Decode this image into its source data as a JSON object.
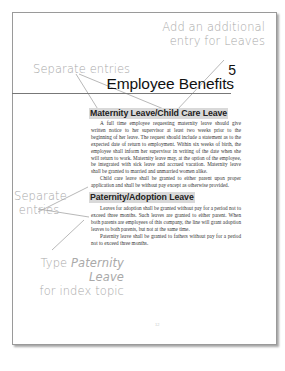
{
  "callouts": {
    "additional_entry": {
      "line1": "Add an additional",
      "line2": "entry for Leaves"
    },
    "separate_entries_top": "Separate entries",
    "separate_entries_left": {
      "line1": "Separate",
      "line2": "entries"
    },
    "type_topic": {
      "prefix": "Type ",
      "italic": "Paternity Leave",
      "line2": "for index topic"
    }
  },
  "chapter": {
    "number": "5",
    "title": "Employee Benefits"
  },
  "sections": [
    {
      "heading": "Maternity Leave/Child Care Leave",
      "paragraphs": [
        "A full time employee requesting maternity leave should give written notice to her supervisor at least two weeks prior to the beginning of her leave. The request should include a statement as to the expected date of return to employment. Within six weeks of birth, the employee shall inform her supervisor in writing of the date when she will return to work. Maternity leave may, at the option of the employee, be integrated with sick leave and accrued vacation. Maternity leave shall be granted to married and unmarried women alike.",
        "Child care leave shall be granted to either parent upon proper application and shall be without pay except as otherwise provided."
      ]
    },
    {
      "heading": "Paternity/Adoption Leave",
      "paragraphs": [
        "Leaves for adoption shall be granted without pay for a period not to exceed three months. Such leaves are granted to either parent. When both parents are employees of this company, the line will grant adoption leaves to both parents, but not at the same time.",
        "Paternity leave shall be granted to fathers without pay for a period not to exceed three months."
      ]
    }
  ],
  "folio": "12",
  "colors": {
    "callout_text": "#a9a9a9",
    "heading_highlight": "#d9d9d9",
    "rule": "#777777"
  }
}
